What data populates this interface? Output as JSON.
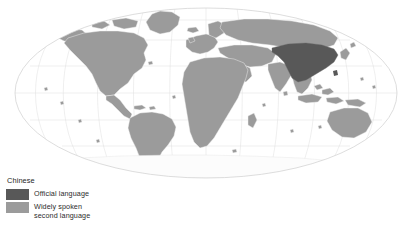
{
  "figure": {
    "kind": "world-choropleth-map",
    "projection": "Mollweide",
    "background_color": "#ffffff"
  },
  "map": {
    "land_color": "#9b9b9b",
    "border_color": "#f2f2f2",
    "graticule_color": "#dcdcdc",
    "outline_color": "#c9c9c9",
    "highlight_color": "#585858",
    "antarctica_color": "#fbfbfb",
    "highlighted_regions": [
      "China"
    ],
    "shaded_regions_note": "Widely spoken second language shown in medium gray across remaining land"
  },
  "legend": {
    "title": "Chinese",
    "entries": [
      {
        "color": "#585858",
        "label": "Official language"
      },
      {
        "color": "#9b9b9b",
        "label": "Widely spoken\nsecond language"
      }
    ]
  }
}
